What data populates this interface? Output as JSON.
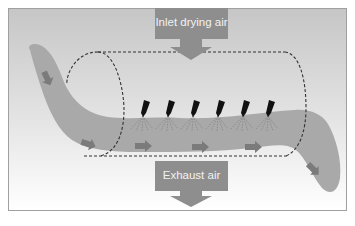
{
  "diagram": {
    "type": "fluid-bed spray coating / drying process schematic",
    "labels": {
      "inlet": "Inlet drying air",
      "exhaust": "Exhaust air"
    },
    "components": {
      "drum": "dashed cylinder (drying chamber)",
      "product_stream": "grey band flowing left to right through the drum",
      "spray_nozzles_count": 6,
      "flow_arrows_count": 6
    },
    "colors": {
      "frame_top": "#c8c8c8",
      "frame_bottom": "#ffffff",
      "frame_border": "#9a9a9a",
      "label_box": "#8c8c8c",
      "label_text": "#f2f2f2",
      "product_band": "#a8a8a8",
      "flow_arrow": "#7a7a7a",
      "nozzle": "#111111",
      "dashed_line": "#333333",
      "spray_lines": "#7a7a7a"
    }
  }
}
